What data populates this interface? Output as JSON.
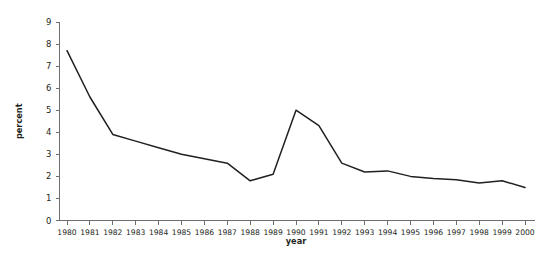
{
  "chart_data": {
    "type": "line",
    "title": "",
    "xlabel": "year",
    "ylabel": "percent",
    "categories": [
      "1980",
      "1981",
      "1982",
      "1983",
      "1984",
      "1985",
      "1986",
      "1987",
      "1988",
      "1989",
      "1990",
      "1991",
      "1992",
      "1993",
      "1994",
      "1995",
      "1996",
      "1997",
      "1998",
      "1999",
      "2000"
    ],
    "values": [
      7.7,
      5.6,
      3.9,
      3.6,
      3.3,
      3.0,
      2.8,
      2.6,
      1.8,
      2.1,
      5.0,
      4.3,
      2.6,
      2.2,
      2.25,
      2.0,
      1.9,
      1.85,
      1.7,
      1.8,
      1.5
    ],
    "series": [
      {
        "name": "percent",
        "values": [
          7.7,
          5.6,
          3.9,
          3.6,
          3.3,
          3.0,
          2.8,
          2.6,
          1.8,
          2.1,
          5.0,
          4.3,
          2.6,
          2.2,
          2.25,
          2.0,
          1.9,
          1.85,
          1.7,
          1.8,
          1.5
        ]
      }
    ],
    "ylim": [
      0,
      9
    ],
    "yticks": [
      0,
      1,
      2,
      3,
      4,
      5,
      6,
      7,
      8,
      9
    ],
    "ytick_labels": [
      "0",
      "1",
      "2",
      "3",
      "4",
      "5",
      "6",
      "7",
      "8",
      "9"
    ],
    "xlim": [
      "1980",
      "2000"
    ],
    "grid": false,
    "legend": false,
    "legend_position": "none",
    "line_color": "#231f20",
    "axis_color": "#6d6e70",
    "background_color": "#ffffff"
  }
}
